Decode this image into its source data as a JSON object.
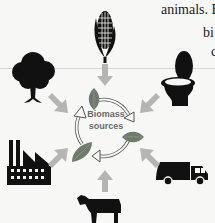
{
  "text_fragments": {
    "line1": "animals. B",
    "line2": "bi",
    "line3": "c"
  },
  "diagram": {
    "center_label_line1": "Biomass",
    "center_label_line2": "sources",
    "sources": [
      {
        "name": "corn",
        "icon": "corn-icon"
      },
      {
        "name": "toilet",
        "icon": "toilet-icon"
      },
      {
        "name": "garbage-truck",
        "icon": "garbage-truck-icon"
      },
      {
        "name": "cow",
        "icon": "cow-icon"
      },
      {
        "name": "factory",
        "icon": "factory-icon"
      },
      {
        "name": "tree",
        "icon": "tree-icon"
      }
    ],
    "colors": {
      "icon": "#111111",
      "arrow": "#b5b5b5",
      "leaf": "#6f7a6c",
      "cycle_arrow_stroke": "#555555",
      "background": "#f7f7f5"
    }
  }
}
